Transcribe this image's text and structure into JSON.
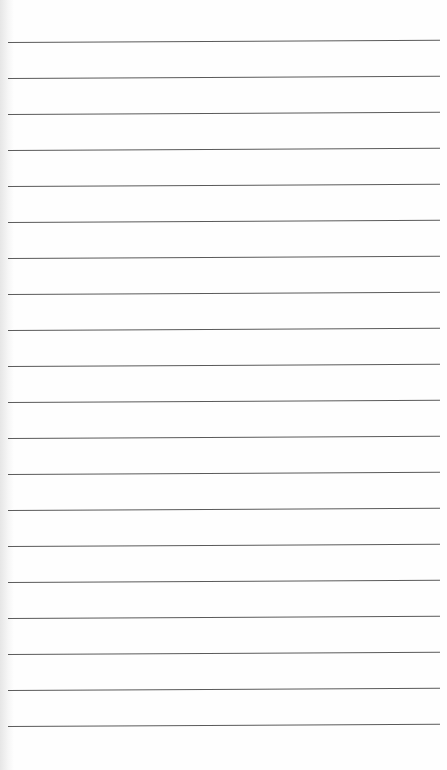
{
  "page": {
    "type": "lined-notepad",
    "line_count": 20,
    "first_line_y": 42,
    "line_spacing": 36,
    "line_color": "#5a5a5a",
    "paper_color": "#fefefe"
  }
}
